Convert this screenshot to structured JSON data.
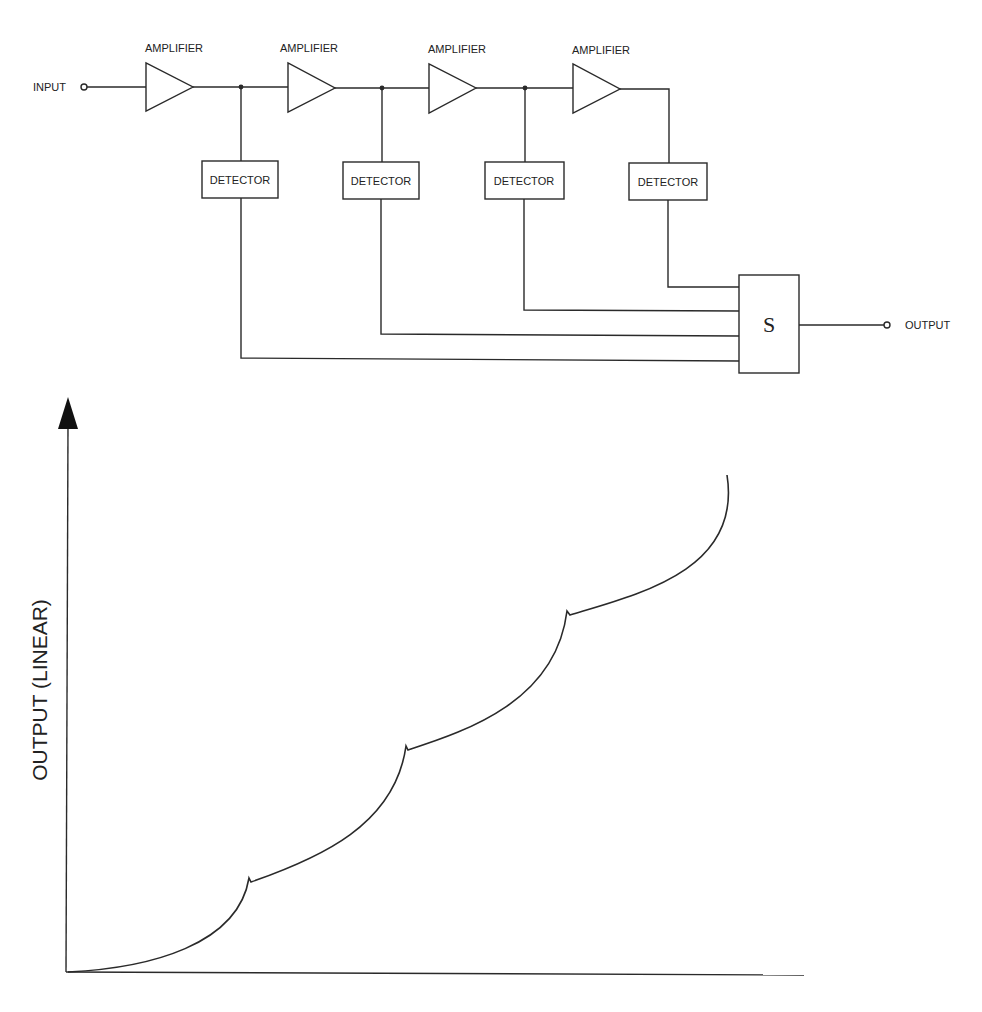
{
  "diagram": {
    "input_label": "INPUT",
    "output_label": "OUTPUT",
    "amplifiers": [
      {
        "label": "AMPLIFIER"
      },
      {
        "label": "AMPLIFIER"
      },
      {
        "label": "AMPLIFIER"
      },
      {
        "label": "AMPLIFIER"
      }
    ],
    "detectors": [
      {
        "label": "DETECTOR"
      },
      {
        "label": "DETECTOR"
      },
      {
        "label": "DETECTOR"
      },
      {
        "label": "DETECTOR"
      }
    ],
    "summer": {
      "label": "S"
    }
  },
  "graph": {
    "y_axis_label": "OUTPUT (LINEAR)",
    "x_axis_label": "",
    "curve_description": "Piecewise-concave output response with four rising segments separated by three knees",
    "knees": [
      {
        "x": 249,
        "y": 878
      },
      {
        "x": 406,
        "y": 746
      },
      {
        "x": 567,
        "y": 611
      }
    ]
  },
  "colors": {
    "ink": "#2a2a2a",
    "background": "#ffffff"
  }
}
